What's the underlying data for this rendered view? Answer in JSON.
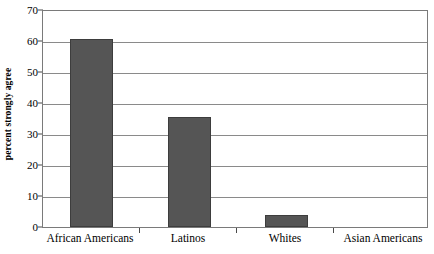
{
  "chart_data": {
    "type": "bar",
    "title": "",
    "xlabel": "",
    "ylabel": "percent strongly agree",
    "categories": [
      "African Americans",
      "Latinos",
      "Whites",
      "Asian Americans"
    ],
    "values": [
      61,
      35.5,
      4,
      0
    ],
    "ylim": [
      0,
      70
    ],
    "yticks": [
      0,
      10,
      20,
      30,
      40,
      50,
      60,
      70
    ],
    "ytick_labels": [
      "0",
      "10",
      "20",
      "30",
      "40",
      "50",
      "60",
      "70"
    ],
    "grid": true,
    "legend": "none",
    "series": [
      {
        "name": "percent strongly agree",
        "values": [
          61,
          35.5,
          4,
          0
        ]
      }
    ]
  },
  "colors": {
    "bar_fill": "#555555",
    "bar_edge": "#3d3d3d",
    "gridline": "#8a8a8a",
    "frame": "#7a7a7a",
    "text": "#000000",
    "background": "#ffffff"
  }
}
